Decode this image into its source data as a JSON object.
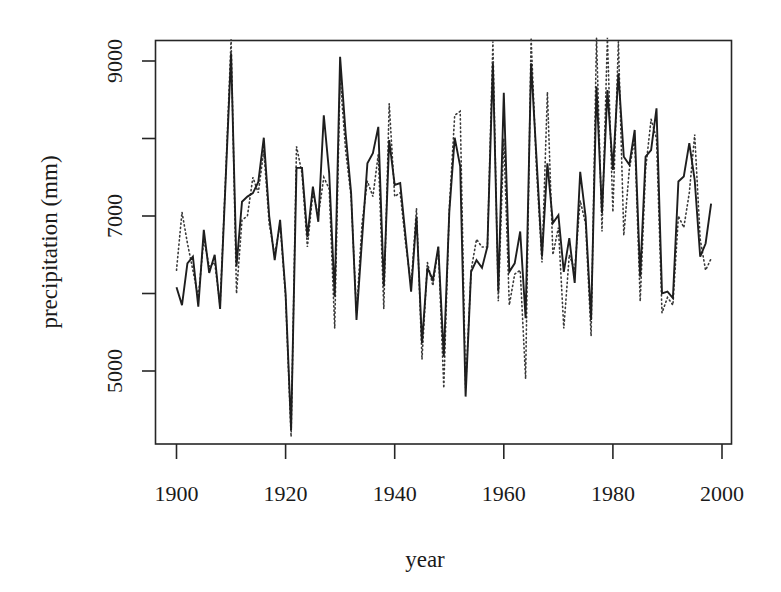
{
  "chart_data": {
    "type": "line",
    "title": "",
    "xlabel": "year",
    "ylabel": "precipitation (mm)",
    "xlim": [
      1896,
      2002
    ],
    "ylim": [
      4000,
      9270
    ],
    "x_ticks": [
      1900,
      1920,
      1940,
      1960,
      1980,
      2000
    ],
    "x_tick_labels": [
      "1900",
      "1920",
      "1940",
      "1960",
      "1980",
      "2000"
    ],
    "y_ticks": [
      5000,
      6000,
      7000,
      8000,
      9000
    ],
    "y_tick_labels": [
      "5000",
      "",
      "7000",
      "",
      "9000"
    ],
    "grid": false,
    "legend": null,
    "x": [
      1900,
      1901,
      1902,
      1903,
      1904,
      1905,
      1906,
      1907,
      1908,
      1909,
      1910,
      1911,
      1912,
      1913,
      1914,
      1915,
      1916,
      1917,
      1918,
      1919,
      1920,
      1921,
      1922,
      1923,
      1924,
      1925,
      1926,
      1927,
      1928,
      1929,
      1930,
      1931,
      1932,
      1933,
      1934,
      1935,
      1936,
      1937,
      1938,
      1939,
      1940,
      1941,
      1942,
      1943,
      1944,
      1945,
      1946,
      1947,
      1948,
      1949,
      1950,
      1951,
      1952,
      1953,
      1954,
      1955,
      1956,
      1957,
      1958,
      1959,
      1960,
      1961,
      1962,
      1963,
      1964,
      1965,
      1966,
      1967,
      1968,
      1969,
      1970,
      1971,
      1972,
      1973,
      1974,
      1975,
      1976,
      1977,
      1978,
      1979,
      1980,
      1981,
      1982,
      1983,
      1984,
      1985,
      1986,
      1987,
      1988,
      1989,
      1990,
      1991,
      1992,
      1993,
      1994,
      1995,
      1996,
      1997,
      1998
    ],
    "series": [
      {
        "name": "observed",
        "style": "solid",
        "values": [
          6080,
          5850,
          6390,
          6475,
          5830,
          6820,
          6265,
          6500,
          5800,
          7450,
          9100,
          6350,
          7185,
          7250,
          7295,
          7440,
          8010,
          7000,
          6430,
          6950,
          6000,
          4240,
          7620,
          7620,
          6730,
          7380,
          6925,
          8300,
          7550,
          5960,
          9055,
          8070,
          7300,
          5660,
          6690,
          7680,
          7810,
          8150,
          6090,
          7980,
          7400,
          7425,
          6730,
          6025,
          6990,
          5360,
          6330,
          6175,
          6605,
          5185,
          7050,
          8010,
          7640,
          4670,
          6280,
          6430,
          6330,
          6605,
          8970,
          6025,
          8590,
          6280,
          6390,
          6800,
          5680,
          8970,
          7750,
          6475,
          7680,
          6910,
          7010,
          6280,
          6715,
          6135,
          7570,
          6990,
          5660,
          8670,
          7040,
          8625,
          7595,
          8840,
          7765,
          7660,
          8110,
          6215,
          7765,
          7850,
          8390,
          6000,
          6025,
          5940,
          7445,
          7510,
          7940,
          7465,
          6475,
          6645,
          7160
        ]
      },
      {
        "name": "modelled",
        "style": "dotted",
        "values": [
          6300,
          7050,
          6650,
          6300,
          5950,
          6700,
          6350,
          6400,
          5850,
          7500,
          9280,
          6000,
          6950,
          7000,
          7500,
          7300,
          7850,
          6900,
          6500,
          6900,
          5950,
          4150,
          7900,
          7550,
          6600,
          7300,
          7000,
          7500,
          7350,
          5550,
          8800,
          7850,
          7250,
          5750,
          6900,
          7450,
          7250,
          7800,
          5800,
          8450,
          7250,
          7300,
          6650,
          6100,
          7100,
          5150,
          6400,
          6100,
          6600,
          4780,
          7100,
          8300,
          8350,
          4780,
          6300,
          6700,
          6600,
          6600,
          9250,
          5900,
          8000,
          5850,
          6250,
          6300,
          4900,
          9300,
          7600,
          6400,
          8600,
          6500,
          6850,
          5550,
          6500,
          6300,
          7200,
          6900,
          5450,
          9300,
          6800,
          9300,
          7050,
          9250,
          6750,
          7600,
          8000,
          5900,
          7600,
          8250,
          8000,
          5750,
          5950,
          5850,
          7000,
          6850,
          7300,
          8050,
          6700,
          6300,
          6450
        ]
      }
    ]
  }
}
